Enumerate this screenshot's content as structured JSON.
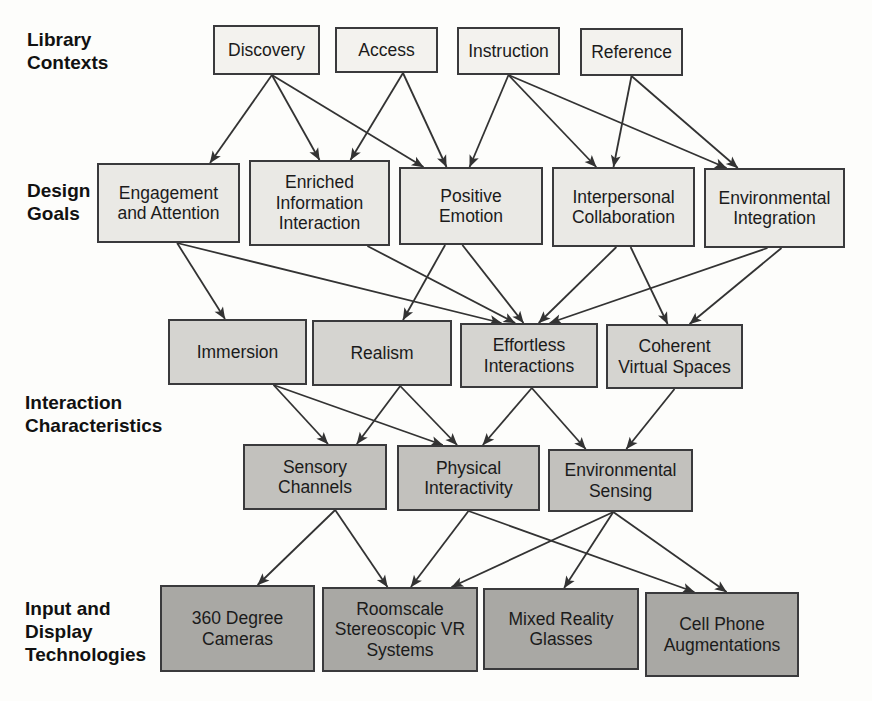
{
  "figure": {
    "background": "#fdfdfb",
    "line_color": "#333333",
    "border_color": "#3a3a3c",
    "text_color": "#1b1b1b",
    "label_color": "#111111"
  },
  "section_labels": [
    {
      "text": "Library\nContexts"
    },
    {
      "text": "Design\nGoals"
    },
    {
      "text": "Interaction\nCharacteristics"
    },
    {
      "text": "Input and\nDisplay\nTechnologies"
    }
  ],
  "rows": {
    "contexts": "#f3f2ee",
    "goals": "#eae9e5",
    "characteristics": "#d5d4d0",
    "capabilities": "#c2c1bd",
    "technologies": "#a9a8a4"
  },
  "nodes": [
    {
      "id": "discovery",
      "label": "Discovery",
      "row": "contexts",
      "x": 213,
      "y": 25,
      "w": 107,
      "h": 50
    },
    {
      "id": "access",
      "label": "Access",
      "row": "contexts",
      "x": 335,
      "y": 27,
      "w": 103,
      "h": 46
    },
    {
      "id": "instruction",
      "label": "Instruction",
      "row": "contexts",
      "x": 457,
      "y": 27,
      "w": 103,
      "h": 48
    },
    {
      "id": "reference",
      "label": "Reference",
      "row": "contexts",
      "x": 580,
      "y": 28,
      "w": 103,
      "h": 48
    },
    {
      "id": "engagement",
      "label": "Engagement\nand Attention",
      "row": "goals",
      "x": 97,
      "y": 163,
      "w": 143,
      "h": 80
    },
    {
      "id": "enriched",
      "label": "Enriched\nInformation\nInteraction",
      "row": "goals",
      "x": 249,
      "y": 160,
      "w": 141,
      "h": 86
    },
    {
      "id": "positive",
      "label": "Positive\nEmotion",
      "row": "goals",
      "x": 399,
      "y": 167,
      "w": 144,
      "h": 78
    },
    {
      "id": "interpersonal",
      "label": "Interpersonal\nCollaboration",
      "row": "goals",
      "x": 552,
      "y": 167,
      "w": 143,
      "h": 80
    },
    {
      "id": "env_integration",
      "label": "Environmental\nIntegration",
      "row": "goals",
      "x": 704,
      "y": 168,
      "w": 141,
      "h": 80
    },
    {
      "id": "immersion",
      "label": "Immersion",
      "row": "characteristics",
      "x": 168,
      "y": 319,
      "w": 139,
      "h": 66
    },
    {
      "id": "realism",
      "label": "Realism",
      "row": "characteristics",
      "x": 312,
      "y": 320,
      "w": 140,
      "h": 66
    },
    {
      "id": "effortless",
      "label": "Effortless\nInteractions",
      "row": "characteristics",
      "x": 460,
      "y": 323,
      "w": 138,
      "h": 65
    },
    {
      "id": "coherent",
      "label": "Coherent\nVirtual Spaces",
      "row": "characteristics",
      "x": 606,
      "y": 324,
      "w": 137,
      "h": 65
    },
    {
      "id": "sensory",
      "label": "Sensory\nChannels",
      "row": "capabilities",
      "x": 243,
      "y": 444,
      "w": 144,
      "h": 66
    },
    {
      "id": "physical",
      "label": "Physical\nInteractivity",
      "row": "capabilities",
      "x": 397,
      "y": 445,
      "w": 143,
      "h": 66
    },
    {
      "id": "env_sensing",
      "label": "Environmental\nSensing",
      "row": "capabilities",
      "x": 548,
      "y": 449,
      "w": 145,
      "h": 63
    },
    {
      "id": "cameras",
      "label": "360 Degree\nCameras",
      "row": "technologies",
      "x": 160,
      "y": 585,
      "w": 155,
      "h": 87
    },
    {
      "id": "roomscale",
      "label": "Roomscale\nStereoscopic VR\nSystems",
      "row": "technologies",
      "x": 322,
      "y": 587,
      "w": 156,
      "h": 85
    },
    {
      "id": "mixed",
      "label": "Mixed Reality\nGlasses",
      "row": "technologies",
      "x": 483,
      "y": 588,
      "w": 156,
      "h": 82
    },
    {
      "id": "cellphone",
      "label": "Cell Phone\nAugmentations",
      "row": "technologies",
      "x": 645,
      "y": 592,
      "w": 154,
      "h": 85
    }
  ],
  "edges": [
    {
      "from": "discovery",
      "to": "engagement",
      "sx": 0.55,
      "tx": 0.79
    },
    {
      "from": "discovery",
      "to": "enriched",
      "sx": 0.55,
      "tx": 0.5
    },
    {
      "from": "discovery",
      "to": "positive",
      "sx": 0.55,
      "tx": 0.17
    },
    {
      "from": "access",
      "to": "enriched",
      "sx": 0.66,
      "tx": 0.72
    },
    {
      "from": "access",
      "to": "positive",
      "sx": 0.66,
      "tx": 0.33
    },
    {
      "from": "instruction",
      "to": "positive",
      "sx": 0.5,
      "tx": 0.49
    },
    {
      "from": "instruction",
      "to": "interpersonal",
      "sx": 0.5,
      "tx": 0.31
    },
    {
      "from": "instruction",
      "to": "env_integration",
      "sx": 0.5,
      "tx": 0.16
    },
    {
      "from": "reference",
      "to": "interpersonal",
      "sx": 0.5,
      "tx": 0.43
    },
    {
      "from": "reference",
      "to": "env_integration",
      "sx": 0.5,
      "tx": 0.24
    },
    {
      "from": "engagement",
      "to": "immersion",
      "sx": 0.56,
      "tx": 0.41
    },
    {
      "from": "engagement",
      "to": "effortless",
      "sx": 0.56,
      "tx": 0.3
    },
    {
      "from": "enriched",
      "to": "effortless",
      "sx": 0.84,
      "tx": 0.4
    },
    {
      "from": "positive",
      "to": "realism",
      "sx": 0.32,
      "tx": 0.65
    },
    {
      "from": "positive",
      "to": "effortless",
      "sx": 0.44,
      "tx": 0.46
    },
    {
      "from": "interpersonal",
      "to": "effortless",
      "sx": 0.45,
      "tx": 0.57
    },
    {
      "from": "interpersonal",
      "to": "coherent",
      "sx": 0.55,
      "tx": 0.45
    },
    {
      "from": "env_integration",
      "to": "effortless",
      "sx": 0.45,
      "tx": 0.65
    },
    {
      "from": "env_integration",
      "to": "coherent",
      "sx": 0.55,
      "tx": 0.61
    },
    {
      "from": "immersion",
      "to": "sensory",
      "sx": 0.76,
      "tx": 0.59
    },
    {
      "from": "immersion",
      "to": "physical",
      "sx": 0.76,
      "tx": 0.32
    },
    {
      "from": "realism",
      "to": "sensory",
      "sx": 0.63,
      "tx": 0.79
    },
    {
      "from": "realism",
      "to": "physical",
      "sx": 0.63,
      "tx": 0.42
    },
    {
      "from": "effortless",
      "to": "physical",
      "sx": 0.52,
      "tx": 0.6
    },
    {
      "from": "effortless",
      "to": "env_sensing",
      "sx": 0.52,
      "tx": 0.26
    },
    {
      "from": "coherent",
      "to": "env_sensing",
      "sx": 0.5,
      "tx": 0.54
    },
    {
      "from": "sensory",
      "to": "cameras",
      "sx": 0.64,
      "tx": 0.63
    },
    {
      "from": "sensory",
      "to": "roomscale",
      "sx": 0.64,
      "tx": 0.42
    },
    {
      "from": "physical",
      "to": "roomscale",
      "sx": 0.5,
      "tx": 0.57
    },
    {
      "from": "physical",
      "to": "cellphone",
      "sx": 0.5,
      "tx": 0.32
    },
    {
      "from": "env_sensing",
      "to": "roomscale",
      "sx": 0.45,
      "tx": 0.83
    },
    {
      "from": "env_sensing",
      "to": "mixed",
      "sx": 0.45,
      "tx": 0.52
    },
    {
      "from": "env_sensing",
      "to": "cellphone",
      "sx": 0.45,
      "tx": 0.53
    }
  ]
}
